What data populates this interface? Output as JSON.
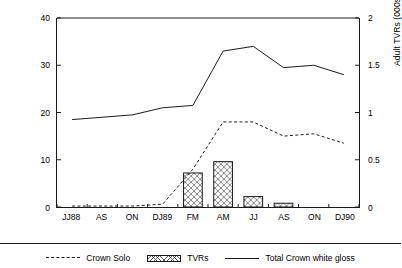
{
  "chart_data": {
    "type": "bar",
    "title": "",
    "subtitle": "",
    "xlabel": "",
    "ylabel": "Volume share (%)",
    "y2label": "Adult TVRs (000s)",
    "categories": [
      "JJ88",
      "AS",
      "ON",
      "DJ89",
      "FM",
      "AM",
      "JJ",
      "AS",
      "ON",
      "DJ90"
    ],
    "ylim": [
      0,
      40
    ],
    "yticks": [
      "0",
      "10",
      "20",
      "30",
      "40"
    ],
    "ytick_values": [
      0,
      10,
      20,
      30,
      40
    ],
    "y2lim": [
      0,
      2
    ],
    "y2ticks": [
      "0",
      "0.5",
      "1",
      "1.5",
      "2"
    ],
    "y2tick_values": [
      0,
      0.5,
      1,
      1.5,
      2
    ],
    "grid": false,
    "legend_position": "bottom",
    "series": [
      {
        "name": "Crown Solo",
        "type": "line",
        "style": "dotted",
        "axis": "left",
        "unit": "%",
        "values": [
          0.2,
          0.2,
          0.2,
          0.6,
          8.0,
          18.0,
          18.0,
          15.0,
          15.5,
          13.5
        ]
      },
      {
        "name": "TVRs",
        "type": "bar",
        "style": "cross-hatch",
        "axis": "right",
        "unit": "000s",
        "values": [
          0,
          0,
          0,
          0,
          0.36,
          0.48,
          0.11,
          0.04,
          0,
          0
        ],
        "values_left_scale": [
          0,
          0,
          0,
          0,
          7.2,
          9.6,
          2.2,
          0.8,
          0,
          0
        ]
      },
      {
        "name": "Total Crown white gloss",
        "type": "line",
        "style": "solid",
        "axis": "left",
        "unit": "%",
        "values": [
          18.5,
          19.0,
          19.5,
          21.0,
          21.5,
          33.0,
          34.0,
          29.5,
          30.0,
          28.0
        ]
      }
    ]
  },
  "legend": {
    "items": [
      {
        "label": "Crown Solo",
        "swatch": "dashed-line-swatch"
      },
      {
        "label": "TVRs",
        "swatch": "hatched-bar-swatch"
      },
      {
        "label": "Total Crown white gloss",
        "swatch": "solid-line-swatch"
      }
    ]
  },
  "colors": {
    "axis": "#1a1a1a",
    "line": "#1a1a1a",
    "bar_fill": "#ffffff",
    "bar_hatch": "#555555",
    "background": "#ffffff"
  }
}
